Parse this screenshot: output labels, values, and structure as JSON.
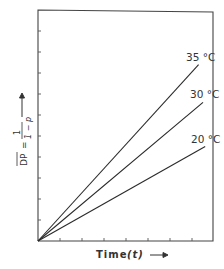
{
  "chart_data": {
    "type": "line",
    "title": "",
    "xlabel": "Time (t) →",
    "ylabel": "DP̄ = 1/(1 − p) →",
    "xlabel_parts": {
      "text": "Time",
      "var": "(t)",
      "arrow": "→"
    },
    "ylabel_parts": {
      "lhs": "DP",
      "eq": "=",
      "num": "1",
      "den": "1 − p",
      "arrow": "→"
    },
    "xlim": [
      0,
      8
    ],
    "ylim": [
      0,
      11
    ],
    "x_ticks": [
      1,
      2,
      3,
      4,
      5,
      6,
      7
    ],
    "y_ticks": [
      1,
      2,
      3,
      4,
      5,
      6,
      7,
      8,
      9,
      10
    ],
    "tick_labels_shown": false,
    "grid": false,
    "legend": "inline labels at line ends",
    "series": [
      {
        "name": "35 °C",
        "label": "35 °C",
        "x": [
          0,
          7.3
        ],
        "y": [
          0,
          8.4
        ]
      },
      {
        "name": "30 °C",
        "label": "30 °C",
        "x": [
          0,
          7.5
        ],
        "y": [
          0,
          6.6
        ]
      },
      {
        "name": "20 °C",
        "label": "20 °C",
        "x": [
          0,
          7.6
        ],
        "y": [
          0,
          4.5
        ]
      }
    ]
  },
  "colors": {
    "line": "#2a2a2a",
    "frame": "#444444",
    "text": "#333333"
  }
}
